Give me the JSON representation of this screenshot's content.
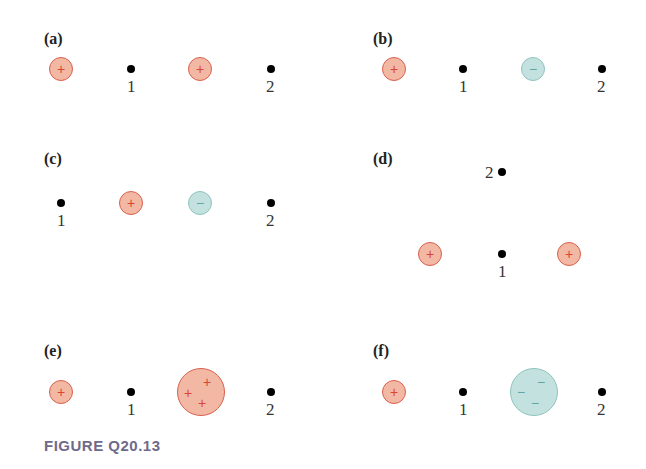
{
  "caption": "FIGURE Q20.13",
  "colors": {
    "positive_fill": "#f2b8a3",
    "positive_stroke": "#d8604e",
    "negative_fill": "#c3e2df",
    "negative_stroke": "#8fc4bf",
    "caption": "#6e6a8a"
  },
  "panels": {
    "a": {
      "label": "(a)",
      "charges": [
        "+",
        "+"
      ],
      "points": [
        "1",
        "2"
      ]
    },
    "b": {
      "label": "(b)",
      "charges": [
        "+",
        "−"
      ],
      "points": [
        "1",
        "2"
      ]
    },
    "c": {
      "label": "(c)",
      "charges": [
        "+",
        "−"
      ],
      "points": [
        "1",
        "2"
      ]
    },
    "d": {
      "label": "(d)",
      "charges": [
        "+",
        "+"
      ],
      "points": [
        "1",
        "2"
      ]
    },
    "e": {
      "label": "(e)",
      "charges": [
        "+",
        "+",
        "+",
        "+"
      ],
      "points": [
        "1",
        "2"
      ]
    },
    "f": {
      "label": "(f)",
      "charges": [
        "+",
        "−",
        "−",
        "−"
      ],
      "points": [
        "1",
        "2"
      ]
    }
  }
}
